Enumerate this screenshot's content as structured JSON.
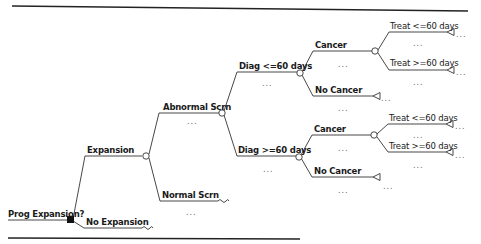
{
  "diagram": {
    "type": "decision-tree",
    "colors": {
      "line": "#333333",
      "text": "#1a1a1a",
      "ellipsis": "#666666",
      "decision_node": "#111111"
    },
    "root": {
      "label": "Prog Expansion?",
      "node": "decision"
    },
    "branches": {
      "expansion": {
        "label": "Expansion",
        "node": "chance"
      },
      "no_expansion": {
        "label": "No Expansion",
        "node": "truncated"
      },
      "abnormal_scrn": {
        "label": "Abnormal Scrn",
        "node": "chance",
        "ellipsis": "..."
      },
      "normal_scrn": {
        "label": "Normal Scrn",
        "node": "truncated",
        "ellipsis": "..."
      },
      "diag_le60": {
        "label": "Diag <=60 days",
        "node": "chance",
        "ellipsis": "..."
      },
      "diag_ge60": {
        "label": "Diag >=60 days",
        "node": "chance",
        "ellipsis": "..."
      },
      "cancer_1": {
        "label": "Cancer",
        "node": "chance",
        "ellipsis": "..."
      },
      "no_cancer_1": {
        "label": "No Cancer",
        "node": "terminal",
        "ellipsis": "...",
        "terminal_text": "..."
      },
      "treat_le60_1": {
        "label": "Treat <=60 days",
        "node": "terminal",
        "ellipsis": "...",
        "terminal_text": "..."
      },
      "treat_ge60_1": {
        "label": "Treat >=60 days",
        "node": "terminal",
        "ellipsis": "...",
        "terminal_text": "..."
      },
      "cancer_2": {
        "label": "Cancer",
        "node": "chance",
        "ellipsis": "..."
      },
      "no_cancer_2": {
        "label": "No Cancer",
        "node": "terminal",
        "ellipsis": "...",
        "terminal_text": "..."
      },
      "treat_le60_2": {
        "label": "Treat <=60 days",
        "node": "terminal",
        "ellipsis": "...",
        "terminal_text": "..."
      },
      "treat_ge60_2": {
        "label": "Treat >=60 days",
        "node": "terminal",
        "ellipsis": "...",
        "terminal_text": "..."
      }
    }
  }
}
